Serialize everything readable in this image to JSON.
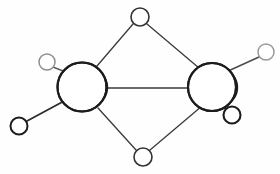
{
  "figure": {
    "background_color": "#fefefe",
    "width": 280,
    "height": 174
  },
  "style": {
    "bond_color": "#3a3a3a",
    "bond_color_light": "#8a8a8a",
    "atom_stroke_dark": "#1c1c1c",
    "atom_stroke_mid": "#4a4a4a",
    "atom_stroke_light": "#9a9a9a",
    "atom_fill": "#ffffff",
    "bond_width": 1.3,
    "central_stroke_width": 2.0
  },
  "atoms": {
    "central": [
      {
        "id": "central-left",
        "label": "left-central-atom",
        "cx": 82,
        "cy": 87,
        "r": 24.5,
        "stroke": "#1c1c1c",
        "stroke_width": 2.1,
        "crescent_side": "right"
      },
      {
        "id": "central-right",
        "label": "right-central-atom",
        "cx": 212,
        "cy": 87,
        "r": 24.0,
        "stroke": "#1c1c1c",
        "stroke_width": 2.1,
        "crescent_side": "right"
      }
    ],
    "bridging": [
      {
        "id": "bridge-top",
        "label": "top-bridging-atom",
        "cx": 140,
        "cy": 17,
        "r": 9.0,
        "stroke": "#333333",
        "stroke_width": 1.6
      },
      {
        "id": "bridge-bottom",
        "label": "bottom-bridging-atom",
        "cx": 143,
        "cy": 157,
        "r": 9.0,
        "stroke": "#333333",
        "stroke_width": 1.6
      }
    ],
    "terminal": [
      {
        "id": "terminal-upper-left",
        "label": "upper-left-terminal-atom",
        "cx": 47,
        "cy": 62,
        "r": 8.0,
        "stroke": "#8e8e8e",
        "stroke_width": 1.5
      },
      {
        "id": "terminal-lower-left",
        "label": "lower-left-terminal-atom",
        "cx": 19,
        "cy": 126,
        "r": 8.5,
        "stroke": "#1c1c1c",
        "stroke_width": 2.0
      },
      {
        "id": "terminal-upper-right",
        "label": "upper-right-terminal-atom",
        "cx": 266,
        "cy": 52,
        "r": 8.0,
        "stroke": "#9a9a9a",
        "stroke_width": 1.5
      },
      {
        "id": "terminal-lower-right",
        "label": "lower-right-terminal-atom",
        "cx": 232,
        "cy": 115,
        "r": 8.5,
        "stroke": "#1c1c1c",
        "stroke_width": 2.1
      }
    ]
  },
  "bonds": [
    {
      "id": "bond-central-central",
      "label": "central-central-bond",
      "x1": 107,
      "y1": 88,
      "x2": 188,
      "y2": 88,
      "stroke": "#3a3a3a",
      "stroke_width": 1.3
    },
    {
      "id": "bond-topbridge-left",
      "label": "top-bridge-to-left-bond",
      "x1": 133,
      "y1": 24,
      "x2": 97,
      "y2": 66,
      "stroke": "#3a3a3a",
      "stroke_width": 1.3
    },
    {
      "id": "bond-topbridge-right",
      "label": "top-bridge-to-right-bond",
      "x1": 147,
      "y1": 24,
      "x2": 199,
      "y2": 68,
      "stroke": "#3a3a3a",
      "stroke_width": 1.3
    },
    {
      "id": "bond-bottombridge-left",
      "label": "bottom-bridge-to-left-bond",
      "x1": 136,
      "y1": 150,
      "x2": 98,
      "y2": 108,
      "stroke": "#3a3a3a",
      "stroke_width": 1.3
    },
    {
      "id": "bond-bottombridge-right",
      "label": "bottom-bridge-to-right-bond",
      "x1": 150,
      "y1": 150,
      "x2": 202,
      "y2": 106,
      "stroke": "#3a3a3a",
      "stroke_width": 1.3
    },
    {
      "id": "bond-left-upperleft",
      "label": "left-to-upper-left-terminal-bond",
      "x1": 53,
      "y1": 67,
      "x2": 68,
      "y2": 73,
      "stroke": "#5a5a5a",
      "stroke_width": 1.4
    },
    {
      "id": "bond-left-lowerleft",
      "label": "left-to-lower-left-terminal-bond",
      "x1": 27,
      "y1": 121,
      "x2": 66,
      "y2": 100,
      "stroke": "#2a2a2a",
      "stroke_width": 1.7
    },
    {
      "id": "bond-right-upperright",
      "label": "right-to-upper-right-terminal-bond",
      "x1": 259,
      "y1": 57,
      "x2": 226,
      "y2": 72,
      "stroke": "#4a4a4a",
      "stroke_width": 1.4
    },
    {
      "id": "bond-right-lowerright",
      "label": "right-to-lower-right-terminal-bond",
      "x1": 226,
      "y1": 109,
      "x2": 214,
      "y2": 97,
      "stroke": "#2a2a2a",
      "stroke_width": 1.9
    }
  ],
  "crescents": [
    {
      "id": "crescent-left-outer",
      "label": "left-atom-shading-arc-outer",
      "path": "M 96 70 A 19 19 0 0 1 92 106",
      "stroke": "#1c1c1c",
      "stroke_width": 1.9
    },
    {
      "id": "crescent-left-inner",
      "label": "left-atom-shading-arc-inner",
      "path": "M 92 74 A 14 14 0 0 1 88 104",
      "stroke": "#1c1c1c",
      "stroke_width": 1.7
    },
    {
      "id": "crescent-left-inner2",
      "label": "left-atom-shading-arc-innermost",
      "path": "M 87 79 A 9 9 0 0 1 84 101",
      "stroke": "#2a2a2a",
      "stroke_width": 1.4
    },
    {
      "id": "crescent-right-outer",
      "label": "right-atom-shading-arc-outer",
      "path": "M 226 70 A 19 19 0 0 1 222 106",
      "stroke": "#1c1c1c",
      "stroke_width": 1.9
    },
    {
      "id": "crescent-right-inner",
      "label": "right-atom-shading-arc-inner",
      "path": "M 222 74 A 14 14 0 0 1 218 104",
      "stroke": "#1c1c1c",
      "stroke_width": 1.7
    },
    {
      "id": "crescent-right-inner2",
      "label": "right-atom-shading-arc-innermost",
      "path": "M 217 79 A 9 9 0 0 1 214 101",
      "stroke": "#2a2a2a",
      "stroke_width": 1.4
    }
  ]
}
